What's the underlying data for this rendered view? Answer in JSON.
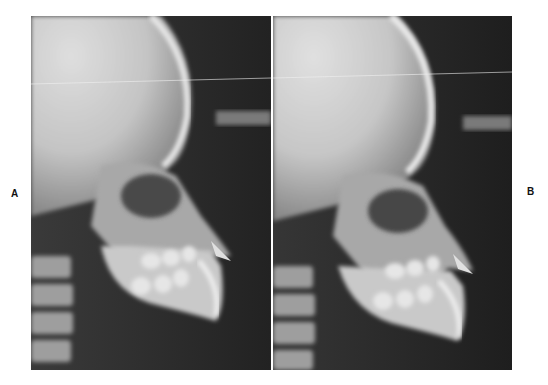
{
  "figure": {
    "panels": [
      {
        "label": "A",
        "description": "Lateral cephalometric radiograph, profile facing right, teeth in occlusion"
      },
      {
        "label": "B",
        "description": "Lateral cephalometric radiograph, profile facing right, mouth slightly open"
      }
    ]
  },
  "colors": {
    "background": "#ffffff",
    "film_dark": "#262626",
    "bone_light": "#d9d9d9",
    "skull_light": "#cfcfcf"
  }
}
